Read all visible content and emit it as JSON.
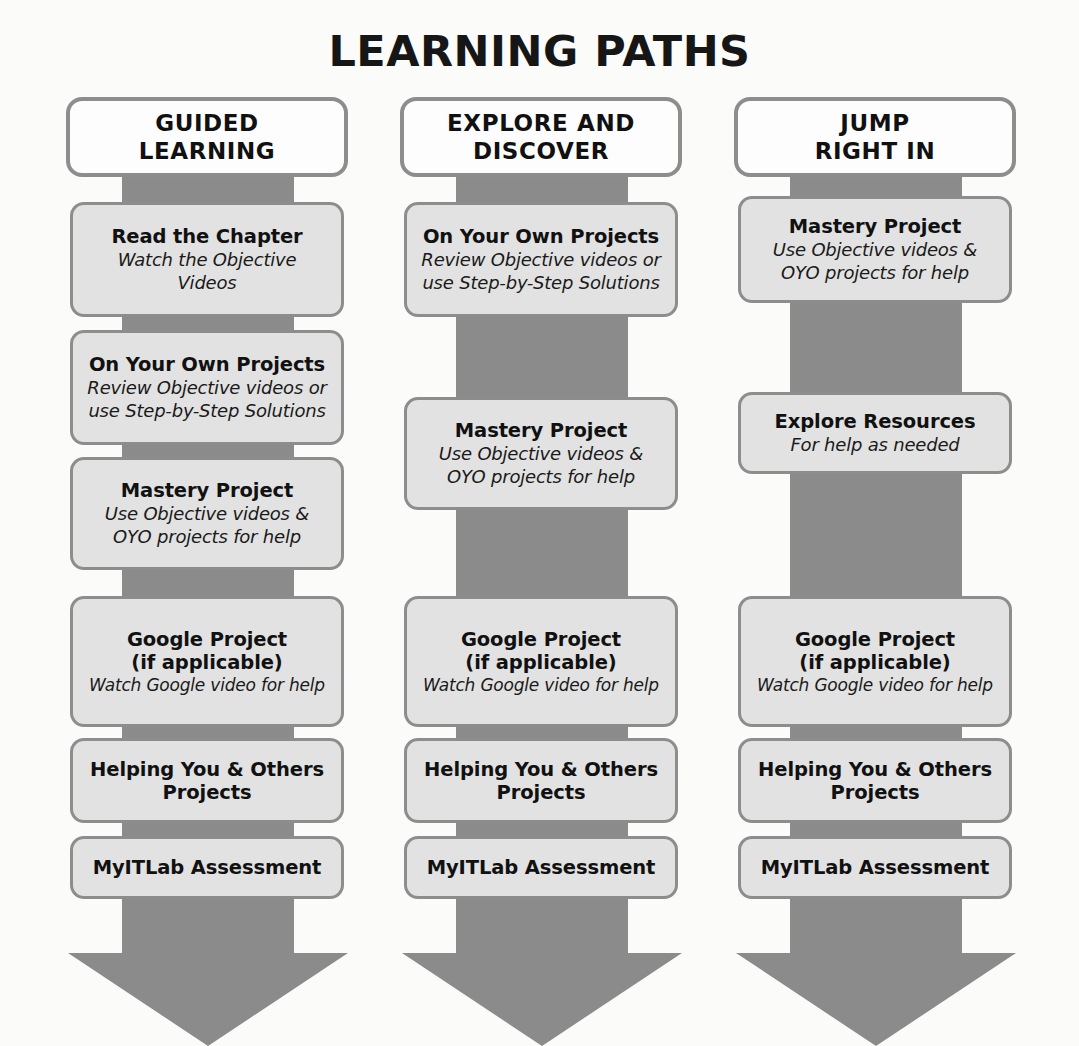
{
  "title": "LEARNING PATHS",
  "theme": {
    "background": "#fbfbfa",
    "arrow_gray": "#8b8b8b",
    "box_fill": "#e2e2e2",
    "header_fill": "#fdfdfd",
    "box_border": "#8d8d8d",
    "text": "#111111"
  },
  "columns": [
    {
      "id": "guided-learning",
      "header": {
        "title": "GUIDED\nLEARNING"
      },
      "nodes": [
        {
          "title": "Read the Chapter",
          "sub": "Watch the Objective\nVideos"
        },
        {
          "title": "On Your Own Projects",
          "sub": "Review Objective videos or\nuse Step-by-Step Solutions"
        },
        {
          "title": "Mastery Project",
          "sub": "Use Objective videos &\nOYO projects for help"
        },
        {
          "title": "Google Project\n(if applicable)",
          "sub": "Watch Google video for help"
        },
        {
          "title": "Helping You & Others\nProjects",
          "sub": ""
        },
        {
          "title": "MyITLab Assessment",
          "sub": ""
        }
      ]
    },
    {
      "id": "explore-and-discover",
      "header": {
        "title": "EXPLORE AND\nDISCOVER"
      },
      "nodes": [
        {
          "title": "On Your Own Projects",
          "sub": "Review Objective videos or\nuse Step-by-Step Solutions"
        },
        {
          "title": "Mastery Project",
          "sub": "Use Objective videos &\nOYO projects for help"
        },
        {
          "title": "Google Project\n(if applicable)",
          "sub": "Watch Google video for help"
        },
        {
          "title": "Helping You & Others\nProjects",
          "sub": ""
        },
        {
          "title": "MyITLab Assessment",
          "sub": ""
        }
      ]
    },
    {
      "id": "jump-right-in",
      "header": {
        "title": "JUMP\nRIGHT IN"
      },
      "nodes": [
        {
          "title": "Mastery Project",
          "sub": "Use Objective videos &\nOYO projects for help"
        },
        {
          "title": "Explore Resources",
          "sub": "For help as needed"
        },
        {
          "title": "Google Project\n(if applicable)",
          "sub": "Watch Google video for help"
        },
        {
          "title": "Helping You & Others\nProjects",
          "sub": ""
        },
        {
          "title": "MyITLab Assessment",
          "sub": ""
        }
      ]
    }
  ],
  "layout": {
    "columns": [
      {
        "header": {
          "top": 0,
          "height": 80
        },
        "nodes": [
          {
            "top": 105,
            "height": 115
          },
          {
            "top": 233,
            "height": 115
          },
          {
            "top": 360,
            "height": 113
          },
          {
            "top": 499,
            "height": 131
          },
          {
            "top": 641,
            "height": 85
          },
          {
            "top": 739,
            "height": 63
          }
        ],
        "stem": {
          "top": 26,
          "bottom": 856
        },
        "head": {
          "top": 856,
          "height": 93
        }
      },
      {
        "header": {
          "top": 0,
          "height": 80
        },
        "nodes": [
          {
            "top": 105,
            "height": 115
          },
          {
            "top": 300,
            "height": 113
          },
          {
            "top": 499,
            "height": 131
          },
          {
            "top": 641,
            "height": 85
          },
          {
            "top": 739,
            "height": 63
          }
        ],
        "stem": {
          "top": 26,
          "bottom": 856
        },
        "head": {
          "top": 856,
          "height": 93
        }
      },
      {
        "header": {
          "top": 0,
          "height": 80
        },
        "nodes": [
          {
            "top": 99,
            "height": 107
          },
          {
            "top": 295,
            "height": 82
          },
          {
            "top": 499,
            "height": 131
          },
          {
            "top": 641,
            "height": 85
          },
          {
            "top": 739,
            "height": 63
          }
        ],
        "stem": {
          "top": 26,
          "bottom": 856
        },
        "head": {
          "top": 856,
          "height": 93
        }
      }
    ]
  }
}
